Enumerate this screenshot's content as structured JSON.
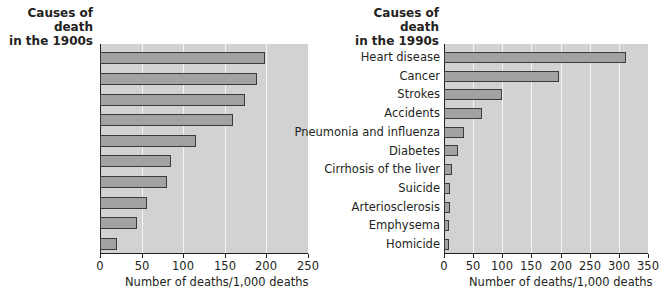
{
  "chart_data": [
    {
      "type": "bar",
      "orientation": "horizontal",
      "title": "Causes of death in the 1900s",
      "title_lines": [
        "Causes of death",
        "in the 1900s"
      ],
      "categories": [
        "Pneumonia and influenza",
        "Tuberculosis",
        "Gastroenteritis",
        "Heart disease",
        "Stroke",
        "Kidney disease",
        "Accidents",
        "Cancer",
        "Infant diseases",
        "Diphtheria"
      ],
      "category_lines": [
        [
          "Pneumonia",
          "and influenza"
        ],
        [
          "Tuberculosis"
        ],
        [
          "Gastroenteritis"
        ],
        [
          "Heart disease"
        ],
        [
          "Stroke"
        ],
        [
          "Kidney disease"
        ],
        [
          "Accidents"
        ],
        [
          "Cancer"
        ],
        [
          "Infant diseases"
        ],
        [
          "Diphtheria"
        ]
      ],
      "values": [
        198,
        189,
        174,
        160,
        115,
        85,
        80,
        56,
        45,
        21
      ],
      "xlabel": "Number of deaths/1,000 deaths",
      "ylabel": "",
      "xlim": [
        0,
        250
      ],
      "xticks": [
        "0",
        "50",
        "100",
        "150",
        "200",
        "250"
      ],
      "grid": true,
      "legend": null
    },
    {
      "type": "bar",
      "orientation": "horizontal",
      "title": "Causes of death in the 1990s",
      "title_lines": [
        "Causes of death",
        "in the 1990s"
      ],
      "categories": [
        "Heart disease",
        "Cancer",
        "Strokes",
        "Accidents",
        "Pneumonia and influenza",
        "Diabetes",
        "Cirrhosis of the liver",
        "Suicide",
        "Arteriosclerosis",
        "Emphysema",
        "Homicide"
      ],
      "values": [
        312,
        197,
        100,
        66,
        34,
        24,
        13,
        11,
        10,
        9,
        8
      ],
      "xlabel": "Number of deaths/1,000 deaths",
      "ylabel": "",
      "xlim": [
        0,
        350
      ],
      "xticks": [
        "0",
        "50",
        "100",
        "150",
        "200",
        "250",
        "300",
        "350"
      ],
      "grid": true,
      "legend": null
    }
  ],
  "colors": {
    "plot_bg": "#d2d2d2",
    "bar_fill": "#a2a2a2",
    "bar_stroke": "#3a3a3a",
    "grid": "#f4f4f4",
    "text": "#231f20"
  }
}
